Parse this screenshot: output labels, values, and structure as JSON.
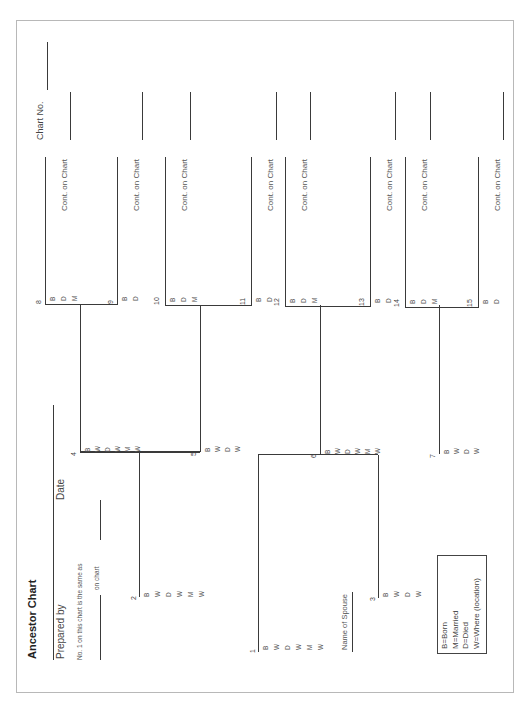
{
  "header": {
    "title": "Ancestor Chart",
    "prepared_by_label": "Prepared by",
    "date_label": "Date",
    "same_as_line1": "No. 1 on this chart is the same as",
    "same_as_line2": "on chart",
    "chart_no_label": "Chart No."
  },
  "cont_label": "Cont. on Chart",
  "spouse_label": "Name of Spouse",
  "persons": [
    {
      "num": "1",
      "codes": [
        "B",
        "W",
        "D",
        "W",
        "M",
        "W"
      ]
    },
    {
      "num": "2",
      "codes": [
        "B",
        "W",
        "D",
        "W",
        "M",
        "W"
      ]
    },
    {
      "num": "3",
      "codes": [
        "B",
        "W",
        "D",
        "W"
      ]
    },
    {
      "num": "4",
      "codes": [
        "B",
        "W",
        "D",
        "W",
        "M",
        "W"
      ]
    },
    {
      "num": "5",
      "codes": [
        "B",
        "W",
        "D",
        "W"
      ]
    },
    {
      "num": "6",
      "codes": [
        "B",
        "W",
        "D",
        "W",
        "M",
        "W"
      ]
    },
    {
      "num": "7",
      "codes": [
        "B",
        "W",
        "D",
        "W"
      ]
    },
    {
      "num": "8",
      "codes": [
        "B",
        "D",
        "M"
      ]
    },
    {
      "num": "9",
      "codes": [
        "B",
        "D"
      ]
    },
    {
      "num": "10",
      "codes": [
        "B",
        "D",
        "M"
      ]
    },
    {
      "num": "11",
      "codes": [
        "B",
        "D"
      ]
    },
    {
      "num": "12",
      "codes": [
        "B",
        "D",
        "M"
      ]
    },
    {
      "num": "13",
      "codes": [
        "B",
        "D"
      ]
    },
    {
      "num": "14",
      "codes": [
        "B",
        "D",
        "M"
      ]
    },
    {
      "num": "15",
      "codes": [
        "B",
        "D"
      ]
    }
  ],
  "legend": [
    "B=Born",
    "M=Married",
    "D=Died",
    "W=Where (location)"
  ]
}
